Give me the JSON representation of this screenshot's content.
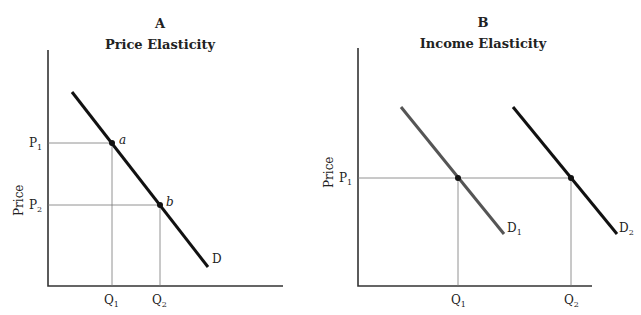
{
  "panels": [
    {
      "letter": "A",
      "title": "Price Elasticity",
      "ylabel": "Price",
      "p1": "P",
      "p1_sub": "1",
      "p2": "P",
      "p2_sub": "2",
      "q1": "Q",
      "q1_sub": "1",
      "q2": "Q",
      "q2_sub": "2",
      "point_a": "a",
      "point_b": "b",
      "curve": "D"
    },
    {
      "letter": "B",
      "title": "Income Elasticity",
      "ylabel": "Price",
      "p1": "P",
      "p1_sub": "1",
      "q1": "Q",
      "q1_sub": "1",
      "q2": "Q",
      "q2_sub": "2",
      "curve1": "D",
      "curve1_sub": "1",
      "curve2": "D",
      "curve2_sub": "2"
    }
  ],
  "colors": {
    "axis": "#333333",
    "guide": "#777777",
    "d_main": "#111111",
    "d1": "#555555",
    "d2": "#111111"
  }
}
